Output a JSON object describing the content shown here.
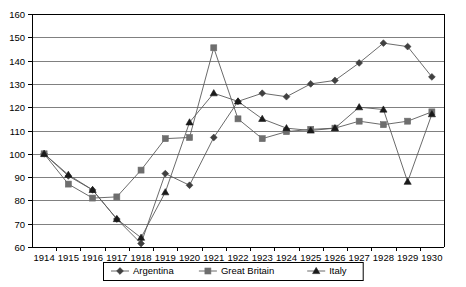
{
  "chart_data": {
    "type": "line",
    "title": "",
    "subtitle": "",
    "xlabel": "",
    "ylabel": "",
    "x": [
      1914,
      1915,
      1916,
      1917,
      1918,
      1919,
      1920,
      1921,
      1922,
      1923,
      1924,
      1925,
      1926,
      1927,
      1928,
      1929,
      1930
    ],
    "categories": [
      "1914",
      "1915",
      "1916",
      "1917",
      "1918",
      "1919",
      "1920",
      "1921",
      "1922",
      "1923",
      "1924",
      "1925",
      "1926",
      "1927",
      "1928",
      "1929",
      "1930"
    ],
    "ylim": [
      60,
      160
    ],
    "yticks": [
      60,
      70,
      80,
      90,
      100,
      110,
      120,
      130,
      140,
      150,
      160
    ],
    "ytick_labels": [
      "60",
      "70",
      "80",
      "90",
      "100",
      "110",
      "120",
      "130",
      "140",
      "150",
      "160"
    ],
    "grid": true,
    "grid_axis": "y",
    "legend_position": "bottom",
    "series": [
      {
        "name": "Argentina",
        "marker": "diamond",
        "color": "#404040",
        "values": [
          100,
          90.5,
          84.5,
          72,
          61.5,
          91.5,
          86.5,
          107,
          122.5,
          126,
          124.5,
          130,
          131.5,
          139,
          147.5,
          146,
          133
        ]
      },
      {
        "name": "Great Britain",
        "marker": "square",
        "color": "#6e6e6e",
        "values": [
          100,
          87,
          81,
          81.5,
          93,
          106.5,
          107,
          145.5,
          115,
          106.5,
          109.5,
          110.5,
          111,
          114,
          112.5,
          114,
          118
        ]
      },
      {
        "name": "Italy",
        "marker": "triangle",
        "color": "#1a1a1a",
        "values": [
          100,
          91,
          84.5,
          72,
          64,
          83.5,
          113.5,
          126,
          122.5,
          115,
          111,
          110,
          111,
          120,
          119,
          88,
          117
        ]
      }
    ],
    "legend": [
      {
        "label": "Argentina",
        "marker": "diamond"
      },
      {
        "label": "Great Britain",
        "marker": "square"
      },
      {
        "label": "Italy",
        "marker": "triangle"
      }
    ],
    "colors": {
      "gridline": "#808080",
      "axis": "#000000",
      "plot_background": "#ffffff",
      "series_line": "#5a5a5a"
    }
  }
}
